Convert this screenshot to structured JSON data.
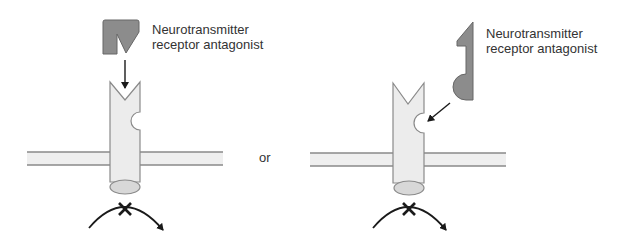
{
  "diagram": {
    "panels": [
      {
        "id": "left",
        "antagonist_label_line1": "Neurotransmitter",
        "antagonist_label_line2": "receptor antagonist",
        "binding_site": "neurotransmitter-binding-site (V notch)",
        "effect": "blocked"
      },
      {
        "id": "right",
        "antagonist_label_line1": "Neurotransmitter",
        "antagonist_label_line2": "receptor antagonist",
        "binding_site": "allosteric-site (semicircle notch)",
        "effect": "blocked"
      }
    ],
    "connector": "or",
    "colors": {
      "antagonist_fill": "#8c8c8c",
      "receptor_fill": "#ececec",
      "membrane_fill": "#eeeeee",
      "outline": "#888888",
      "arrow": "#1a1a1a",
      "text": "#333333"
    }
  }
}
